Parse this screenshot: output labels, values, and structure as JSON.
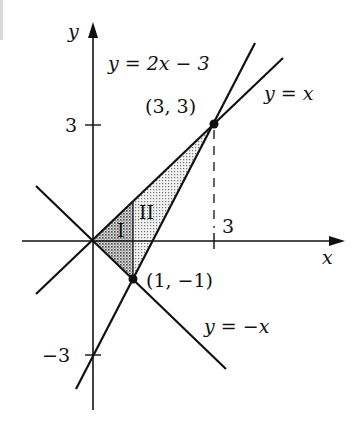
{
  "figure": {
    "type": "region-diagram",
    "axes": {
      "x_label": "x",
      "y_label": "y",
      "y_ticks": [
        {
          "value": 3,
          "label": "3"
        },
        {
          "value": -3,
          "label": "−3"
        }
      ],
      "x_ticks": [
        {
          "value": 3,
          "label": "3"
        }
      ]
    },
    "lines": [
      {
        "equation": "y = 2x − 3",
        "label": "y = 2x − 3"
      },
      {
        "equation": "y = x",
        "label": "y = x"
      },
      {
        "equation": "y = −x",
        "label": "y = −x"
      }
    ],
    "points": [
      {
        "label": "(3, 3)",
        "x": 3,
        "y": 3
      },
      {
        "label": "(1, −1)",
        "x": 1,
        "y": -1
      }
    ],
    "regions": [
      {
        "label": "I",
        "shade": "dark"
      },
      {
        "label": "II",
        "shade": "light"
      }
    ],
    "dashed_guide": {
      "from": "(3, 3)",
      "to": "(3, 0)"
    }
  },
  "colors": {
    "ink": "#111111",
    "region_dark": "#9a9a9a",
    "region_light": "#d4d4d4",
    "background": "#ffffff"
  }
}
